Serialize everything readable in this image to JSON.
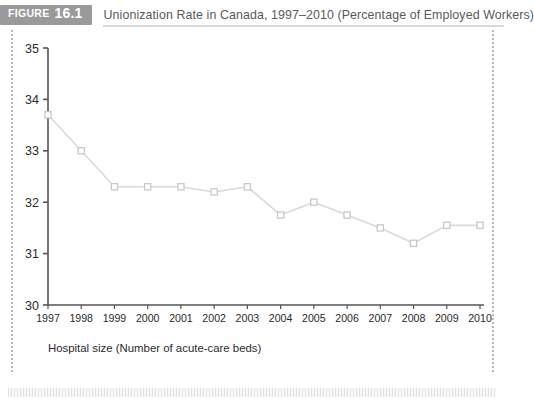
{
  "figure": {
    "badge_word": "FIGURE",
    "badge_number": "16.1",
    "title": "Unionization Rate in Canada, 1997–2010 (Percentage of Employed Workers)"
  },
  "colors": {
    "badge_background": "#9a9a9a",
    "badge_text": "#ffffff",
    "title_text": "#5a5a5a",
    "axis": "#555555",
    "series_line": "#d9d9d9",
    "marker_stroke": "#c9c9c9",
    "plot_background": "#ffffff",
    "frame_dots": "#b9b9b9"
  },
  "chart_data": {
    "type": "line",
    "title": "Unionization Rate in Canada, 1997–2010 (Percentage of Employed Workers)",
    "xlabel": "Hospital size (Number of acute-care beds)",
    "ylabel": "",
    "categories": [
      "1997",
      "1998",
      "1999",
      "2000",
      "2001",
      "2002",
      "2003",
      "2004",
      "2005",
      "2006",
      "2007",
      "2008",
      "2009",
      "2010"
    ],
    "values": [
      33.7,
      33.0,
      32.3,
      32.3,
      32.3,
      32.2,
      32.3,
      31.75,
      32.0,
      31.75,
      31.5,
      31.2,
      31.55,
      31.55
    ],
    "series": [
      {
        "name": "Unionization rate",
        "values": [
          33.7,
          33.0,
          32.3,
          32.3,
          32.3,
          32.2,
          32.3,
          31.75,
          32.0,
          31.75,
          31.5,
          31.2,
          31.55,
          31.55
        ]
      }
    ],
    "ylim": [
      30,
      35
    ],
    "yticks": [
      30,
      31,
      32,
      33,
      34,
      35
    ],
    "ytick_labels": [
      "30",
      "31",
      "32",
      "33",
      "34",
      "35"
    ],
    "xtick_labels": [
      "1997",
      "1998",
      "1999",
      "2000",
      "2001",
      "2002",
      "2003",
      "2004",
      "2005",
      "2006",
      "2007",
      "2008",
      "2009",
      "2010"
    ],
    "grid": false,
    "legend": false,
    "marker": "square"
  }
}
